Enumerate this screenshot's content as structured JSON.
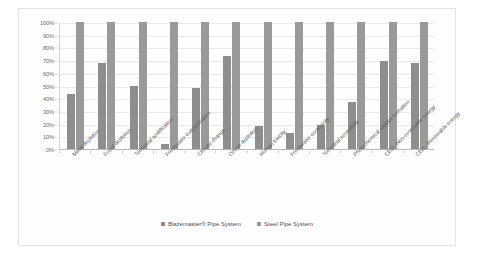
{
  "chart_data": {
    "type": "bar",
    "title": "",
    "xlabel": "",
    "ylabel": "",
    "ylim": [
      0,
      100
    ],
    "ytick_labels": [
      "100%",
      "90%",
      "80%",
      "70%",
      "60%",
      "50%",
      "40%",
      "30%",
      "20%",
      "10%",
      "0%"
    ],
    "ytick_values": [
      100,
      90,
      80,
      70,
      60,
      50,
      40,
      30,
      20,
      10,
      0
    ],
    "grid": true,
    "legend_position": "bottom",
    "categories": [
      "Metal depletion",
      "Fossil depletion",
      "Terrestrial acidification",
      "Freshwater eutrophication",
      "Climate change",
      "Ozone depletion",
      "Human toxicity",
      "Freshwater ecotoxicity",
      "Terrestrial ecotoxicity",
      "Photochemical oxidant formation",
      "CED - Non-renewable energy",
      "CED - Renewable energy"
    ],
    "series": [
      {
        "name": "Blazemaster® Pipe System",
        "color": "#8e8e8e",
        "values": [
          43,
          68,
          50,
          4,
          48,
          73,
          18,
          13,
          19,
          37,
          69,
          68
        ]
      },
      {
        "name": "Steel Pipe System",
        "color": "#9a9a9a",
        "values": [
          100,
          100,
          100,
          100,
          100,
          100,
          100,
          100,
          100,
          100,
          100,
          100
        ]
      }
    ]
  },
  "legend": {
    "items": [
      {
        "label": "Blazemaster® Pipe System"
      },
      {
        "label": "Steel Pipe System"
      }
    ]
  }
}
